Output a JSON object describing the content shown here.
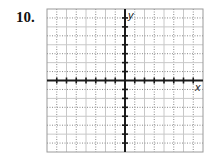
{
  "problem": {
    "number": "10."
  },
  "chart_data": {
    "type": "line",
    "title": "",
    "xlabel": "x",
    "ylabel": "y",
    "xlim": [
      -8,
      8
    ],
    "ylim": [
      -8,
      8
    ],
    "grid": true,
    "tick_step": 1,
    "series": [],
    "note": "Blank coordinate grid with x and y axes, tick marks at each unit, no plotted data"
  },
  "axes": {
    "x_label": "x",
    "y_label": "y"
  },
  "colors": {
    "axis": "#1a1a1a",
    "grid_solid": "#c8c8c8",
    "grid_dotted": "#8a8a8a",
    "border": "#9a9a9a"
  }
}
